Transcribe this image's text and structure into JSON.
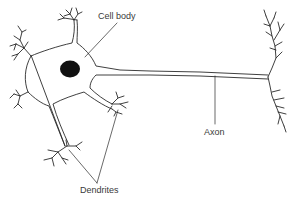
{
  "diagram": {
    "labels": {
      "cell_body": "Cell body",
      "axon": "Axon",
      "dendrites": "Dendrites"
    },
    "colors": {
      "stroke": "#2a2a2a",
      "nucleus": "#111111",
      "background": "#ffffff",
      "text": "#3a3a3a"
    }
  }
}
